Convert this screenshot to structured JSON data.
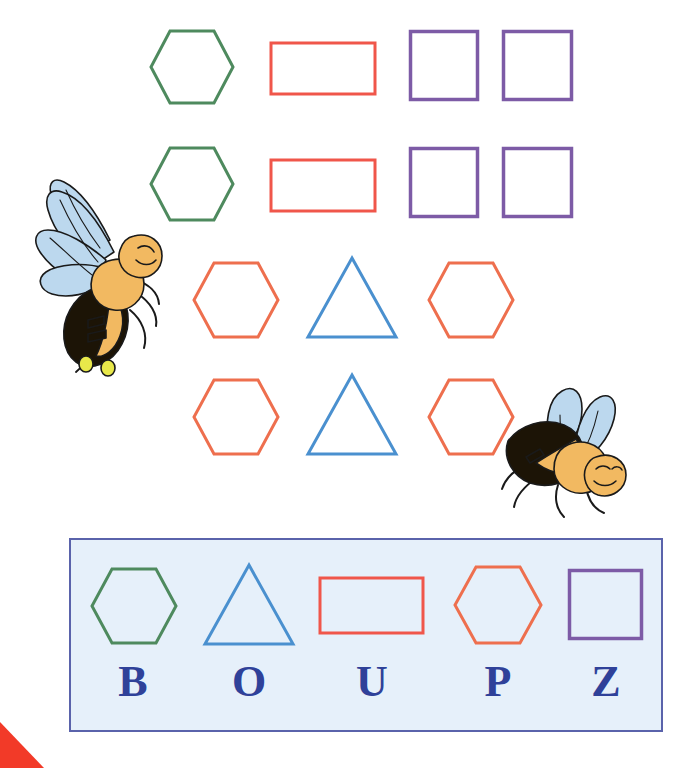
{
  "page": {
    "background_color": "#ffffff",
    "width": 689,
    "height": 768
  },
  "colors": {
    "green": "#4e8a5e",
    "red": "#f0564a",
    "purple": "#7d5ba6",
    "orange": "#ee6f4e",
    "blue": "#4a90cf",
    "letter_blue": "#2f4199",
    "panel_fill": "#e6f0fa",
    "panel_border": "#5a63ab",
    "bee_wing": "#bcd8ee",
    "bee_body_yellow": "#f2b961",
    "bee_body_dark": "#1c1406",
    "corner_red": "#f23a28"
  },
  "shape_rows": [
    {
      "row_name": "row-1",
      "shapes": [
        {
          "name": "hexagon",
          "color_key": "green",
          "color": "#4e8a5e"
        },
        {
          "name": "rectangle",
          "color_key": "red",
          "color": "#f0564a"
        },
        {
          "name": "square",
          "color_key": "purple",
          "color": "#7d5ba6"
        },
        {
          "name": "square",
          "color_key": "purple",
          "color": "#7d5ba6"
        }
      ]
    },
    {
      "row_name": "row-2",
      "shapes": [
        {
          "name": "hexagon",
          "color_key": "green",
          "color": "#4e8a5e"
        },
        {
          "name": "rectangle",
          "color_key": "red",
          "color": "#f0564a"
        },
        {
          "name": "square",
          "color_key": "purple",
          "color": "#7d5ba6"
        },
        {
          "name": "square",
          "color_key": "purple",
          "color": "#7d5ba6"
        }
      ]
    },
    {
      "row_name": "row-3",
      "shapes": [
        {
          "name": "hexagon",
          "color_key": "orange",
          "color": "#ee6f4e"
        },
        {
          "name": "triangle",
          "color_key": "blue",
          "color": "#4a90cf"
        },
        {
          "name": "hexagon",
          "color_key": "orange",
          "color": "#ee6f4e"
        }
      ]
    },
    {
      "row_name": "row-4",
      "shapes": [
        {
          "name": "hexagon",
          "color_key": "orange",
          "color": "#ee6f4e"
        },
        {
          "name": "triangle",
          "color_key": "blue",
          "color": "#4a90cf"
        },
        {
          "name": "hexagon",
          "color_key": "orange",
          "color": "#ee6f4e"
        }
      ]
    }
  ],
  "legend_panel": {
    "name": "shape-letter-key-panel",
    "items": [
      {
        "shape": "hexagon",
        "shape_color": "#4e8a5e",
        "letter": "B"
      },
      {
        "shape": "triangle",
        "shape_color": "#4a90cf",
        "letter": "O"
      },
      {
        "shape": "rectangle",
        "shape_color": "#f0564a",
        "letter": "U"
      },
      {
        "shape": "hexagon",
        "shape_color": "#ee6f4e",
        "letter": "P"
      },
      {
        "shape": "square",
        "shape_color": "#7d5ba6",
        "letter": "Z"
      }
    ]
  },
  "decorations": {
    "bee_left": "bee-illustration",
    "bee_right": "bee-illustration",
    "corner_wedge": "red-corner-wedge"
  }
}
